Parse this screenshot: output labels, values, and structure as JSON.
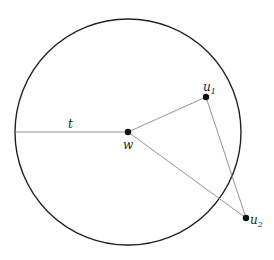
{
  "diagram": {
    "labels": {
      "radius": "t",
      "center": "w",
      "u1_base": "u",
      "u1_sub": "1",
      "u2_base": "u",
      "u2_sub": "2"
    },
    "edges": [
      [
        "w",
        "u1"
      ],
      [
        "w",
        "u2"
      ],
      [
        "u1",
        "u2"
      ],
      [
        "circle-left",
        "w"
      ]
    ],
    "colors": {
      "circle": "#222222",
      "edge": "#888888",
      "point": "#111111"
    }
  }
}
